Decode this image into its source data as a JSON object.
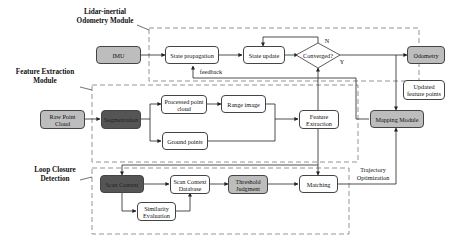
{
  "modules": {
    "odometry": "Lidar-inertial Odometry Module",
    "odometry_line1": "Lidar-inertial",
    "odometry_line2": "Odometry Module",
    "feature": "Feature Extraction Module",
    "feature_line1": "Feature Extraction",
    "feature_line2": "Module",
    "loop": "Loop Closure Detection",
    "loop_line1": "Loop Closure",
    "loop_line2": "Detection"
  },
  "nodes": {
    "imu": "IMU",
    "state_propagation": "State propagation",
    "state_update": "State update",
    "converged": "Converged?",
    "odometry": "Odometry",
    "updated_feature_points_1": "Updated",
    "updated_feature_points_2": "feature points",
    "raw_point_cloud_1": "Raw Point",
    "raw_point_cloud_2": "Cloud",
    "segmentation": "Segmentation",
    "processed_point_cloud_1": "Processed point",
    "processed_point_cloud_2": "cloud",
    "range_image": "Range image",
    "ground_points": "Ground points",
    "feature_extraction_1": "Feature",
    "feature_extraction_2": "Extraction",
    "mapping_module": "Mapping Module",
    "scan_context": "Scan Context",
    "scan_context_database_1": "Scan Context",
    "scan_context_database_2": "Database",
    "threshold_judgment_1": "Threshold",
    "threshold_judgment_2": "Judgment",
    "matching": "Matching",
    "similarity_evaluation_1": "Similarity",
    "similarity_evaluation_2": "Evaluation"
  },
  "edge_labels": {
    "feedback": "feedback",
    "no": "N",
    "yes": "Y",
    "trajectory_optimization_1": "Trajectory",
    "trajectory_optimization_2": "Optimization"
  },
  "colors": {
    "light_gray": "#bdbdbd",
    "dark_gray": "#555555",
    "line": "#333333",
    "dash": "#888888"
  }
}
